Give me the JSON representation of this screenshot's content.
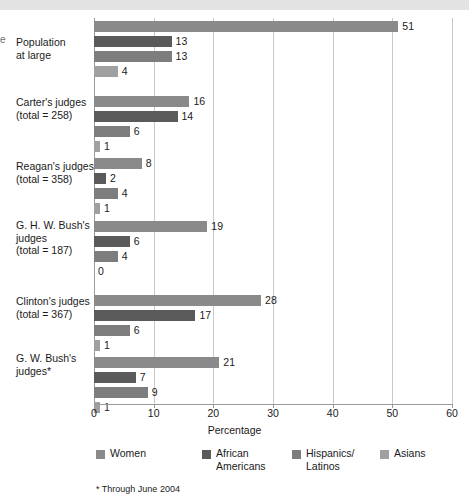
{
  "top_band": {
    "color": "#e3e3e3"
  },
  "edge_glyph": "e",
  "chart_data": {
    "type": "bar",
    "orientation": "horizontal",
    "title": "",
    "xlabel": "Percentage",
    "ylabel": "",
    "xlim": [
      0,
      60
    ],
    "xticks": [
      0,
      10,
      20,
      30,
      40,
      50,
      60
    ],
    "xtick_labels": [
      "0",
      "10",
      "20",
      "30",
      "40",
      "50",
      "60"
    ],
    "grid": true,
    "grid_axis": "x",
    "legend_position": "bottom",
    "categories": [
      "Population at large",
      "Carter's judges (total = 258)",
      "Reagan's judges (total = 358)",
      "G. H. W. Bush's judges (total = 187)",
      "Clinton's judges (total = 367)",
      "G. W. Bush's judges*"
    ],
    "category_lines": [
      [
        "Population",
        "at large"
      ],
      [
        "Carter's judges",
        "(total = 258)"
      ],
      [
        "Reagan's judges",
        "(total = 358)"
      ],
      [
        "G. H. W. Bush's",
        "judges",
        "(total = 187)"
      ],
      [
        "Clinton's judges",
        "(total = 367)"
      ],
      [
        "G. W. Bush's",
        "judges*"
      ]
    ],
    "series": [
      {
        "name": "Women",
        "color": "#8a8a8a",
        "values": [
          51,
          16,
          8,
          19,
          28,
          21
        ]
      },
      {
        "name": "African Americans",
        "color": "#5a5a5a",
        "values": [
          13,
          14,
          2,
          6,
          17,
          7
        ]
      },
      {
        "name": "Hispanics/Latinos",
        "color": "#7d7d7d",
        "values": [
          13,
          6,
          4,
          4,
          6,
          9
        ]
      },
      {
        "name": "Asians",
        "color": "#a0a0a0",
        "values": [
          4,
          1,
          1,
          0,
          1,
          1
        ]
      }
    ],
    "legend_entries": [
      {
        "label": "Women",
        "lines": [
          "Women"
        ],
        "color": "#8a8a8a"
      },
      {
        "label": "African Americans",
        "lines": [
          "African",
          "Americans"
        ],
        "color": "#5a5a5a"
      },
      {
        "label": "Hispanics/Latinos",
        "lines": [
          "Hispanics/",
          "Latinos"
        ],
        "color": "#7d7d7d"
      },
      {
        "label": "Asians",
        "lines": [
          "Asians"
        ],
        "color": "#a0a0a0"
      }
    ],
    "footnote": "* Through June 2004"
  }
}
